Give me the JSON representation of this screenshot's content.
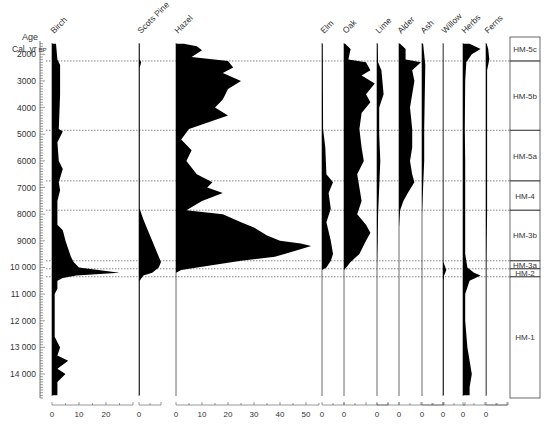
{
  "header": {
    "age_label": "Age",
    "age_unit": "Cal. yr",
    "age_unit_suffix": "BP"
  },
  "colors": {
    "fill": "#000000",
    "axis": "#555555",
    "dotted": "#555555",
    "text": "#333333"
  },
  "chart_data": {
    "type": "area",
    "title": "",
    "ylabel": "Age Cal. yr BP",
    "xlabel": "%",
    "y_axis": {
      "range": [
        1500,
        15000
      ],
      "ticks": [
        2000,
        3000,
        4000,
        5000,
        6000,
        7000,
        8000,
        9000,
        10000,
        11000,
        12000,
        13000,
        14000
      ],
      "tick_labels": [
        "2000",
        "3000",
        "4000",
        "5000",
        "6000",
        "7000",
        "8000",
        "9000",
        "10 000",
        "11 000",
        "12 000",
        "13 000",
        "14 000"
      ],
      "minor_step": 100
    },
    "zones": [
      {
        "name": "HM-5c",
        "top": 1500,
        "bottom": 2250
      },
      {
        "name": "HM-5b",
        "top": 2250,
        "bottom": 4850
      },
      {
        "name": "HM-5a",
        "top": 4850,
        "bottom": 6750
      },
      {
        "name": "HM-4",
        "top": 6750,
        "bottom": 7850
      },
      {
        "name": "HM-3b",
        "top": 7850,
        "bottom": 9750
      },
      {
        "name": "HM-3a",
        "top": 9750,
        "bottom": 10050
      },
      {
        "name": "HM-2",
        "top": 10050,
        "bottom": 10350
      },
      {
        "name": "HM-1",
        "top": 10350,
        "bottom": 14900
      }
    ],
    "zone_boundaries": [
      2250,
      4850,
      6750,
      7850,
      9750,
      10050,
      10350
    ],
    "series": [
      {
        "name": "Birch",
        "x0": 52,
        "scale_max": 30,
        "px_per_unit": 2.7,
        "ticks": [
          0,
          10,
          20
        ],
        "tick_labels": [
          "0",
          "10",
          "20"
        ],
        "points": [
          [
            1600,
            1.5
          ],
          [
            2200,
            2
          ],
          [
            2400,
            3
          ],
          [
            3500,
            3
          ],
          [
            4800,
            2.5
          ],
          [
            4900,
            4
          ],
          [
            5300,
            2
          ],
          [
            6000,
            2.5
          ],
          [
            6300,
            4
          ],
          [
            6800,
            2.5
          ],
          [
            7100,
            3
          ],
          [
            7500,
            2
          ],
          [
            8100,
            2
          ],
          [
            8400,
            2
          ],
          [
            8600,
            4
          ],
          [
            9000,
            5
          ],
          [
            9300,
            6
          ],
          [
            9600,
            7
          ],
          [
            9800,
            8
          ],
          [
            10000,
            10
          ],
          [
            10200,
            25
          ],
          [
            10300,
            9
          ],
          [
            10400,
            4
          ],
          [
            10500,
            2
          ],
          [
            10800,
            2
          ],
          [
            11000,
            1
          ],
          [
            12000,
            1
          ],
          [
            12600,
            1
          ],
          [
            13000,
            3
          ],
          [
            13300,
            2
          ],
          [
            13500,
            6
          ],
          [
            13800,
            2
          ],
          [
            14000,
            5
          ],
          [
            14300,
            2
          ],
          [
            14800,
            2
          ]
        ]
      },
      {
        "name": "Scots Pine",
        "x0": 139,
        "scale_max": 10,
        "px_per_unit": 2.2,
        "ticks": [
          0
        ],
        "tick_labels": [
          "0"
        ],
        "points": [
          [
            1600,
            0.3
          ],
          [
            2200,
            0.3
          ],
          [
            2300,
            1
          ],
          [
            2500,
            0.3
          ],
          [
            7800,
            0.3
          ],
          [
            8200,
            2
          ],
          [
            8600,
            4
          ],
          [
            9000,
            6
          ],
          [
            9400,
            8
          ],
          [
            9800,
            10
          ],
          [
            10000,
            9
          ],
          [
            10200,
            6
          ],
          [
            10300,
            2
          ],
          [
            10500,
            0.3
          ],
          [
            14800,
            0.3
          ]
        ]
      },
      {
        "name": "Hazel",
        "x0": 176,
        "scale_max": 55,
        "px_per_unit": 2.6,
        "ticks": [
          0,
          10,
          20,
          30,
          40,
          50
        ],
        "tick_labels": [
          "0",
          "10",
          "20",
          "30",
          "40",
          "50"
        ],
        "points": [
          [
            1600,
            3
          ],
          [
            1700,
            8
          ],
          [
            1850,
            10
          ],
          [
            2100,
            6
          ],
          [
            2250,
            20
          ],
          [
            2500,
            22
          ],
          [
            2700,
            18
          ],
          [
            3000,
            25
          ],
          [
            3300,
            20
          ],
          [
            3700,
            18
          ],
          [
            4000,
            15
          ],
          [
            4300,
            20
          ],
          [
            4800,
            5
          ],
          [
            5200,
            2
          ],
          [
            5600,
            6
          ],
          [
            6000,
            4
          ],
          [
            6500,
            8
          ],
          [
            6800,
            14
          ],
          [
            7000,
            12
          ],
          [
            7200,
            18
          ],
          [
            7500,
            10
          ],
          [
            7850,
            4
          ],
          [
            8000,
            18
          ],
          [
            8300,
            25
          ],
          [
            8500,
            30
          ],
          [
            8800,
            35
          ],
          [
            9000,
            40
          ],
          [
            9100,
            48
          ],
          [
            9200,
            52
          ],
          [
            9400,
            45
          ],
          [
            9600,
            38
          ],
          [
            9750,
            25
          ],
          [
            9900,
            15
          ],
          [
            10050,
            5
          ],
          [
            10100,
            2
          ],
          [
            10200,
            0
          ],
          [
            14800,
            0
          ]
        ]
      },
      {
        "name": "Elm",
        "x0": 322,
        "scale_max": 10,
        "px_per_unit": 2.2,
        "ticks": [
          0
        ],
        "tick_labels": [
          "0"
        ],
        "points": [
          [
            1600,
            0.3
          ],
          [
            4800,
            0.5
          ],
          [
            5500,
            1.5
          ],
          [
            6500,
            2
          ],
          [
            6800,
            5
          ],
          [
            7200,
            3
          ],
          [
            7800,
            4
          ],
          [
            8300,
            2
          ],
          [
            9000,
            4
          ],
          [
            9500,
            5
          ],
          [
            9750,
            4
          ],
          [
            10000,
            2
          ],
          [
            10100,
            0
          ],
          [
            14800,
            0
          ]
        ]
      },
      {
        "name": "Oak",
        "x0": 344,
        "scale_max": 20,
        "px_per_unit": 2.2,
        "ticks": [
          0
        ],
        "tick_labels": [
          "0"
        ],
        "points": [
          [
            1600,
            0.5
          ],
          [
            1800,
            3
          ],
          [
            2200,
            2
          ],
          [
            2300,
            10
          ],
          [
            2600,
            12
          ],
          [
            2800,
            8
          ],
          [
            3100,
            14
          ],
          [
            3500,
            10
          ],
          [
            3800,
            12
          ],
          [
            4200,
            8
          ],
          [
            4800,
            7
          ],
          [
            5500,
            8
          ],
          [
            6000,
            9
          ],
          [
            6500,
            6
          ],
          [
            7000,
            7
          ],
          [
            7500,
            8
          ],
          [
            8000,
            6
          ],
          [
            8400,
            10
          ],
          [
            8700,
            12
          ],
          [
            9000,
            10
          ],
          [
            9500,
            7
          ],
          [
            9800,
            3
          ],
          [
            10000,
            1
          ],
          [
            10100,
            0
          ],
          [
            14800,
            0
          ]
        ]
      },
      {
        "name": "Lime",
        "x0": 377,
        "scale_max": 10,
        "px_per_unit": 2.2,
        "ticks": [
          0
        ],
        "tick_labels": [
          "0"
        ],
        "points": [
          [
            1600,
            0.3
          ],
          [
            2300,
            0.5
          ],
          [
            2600,
            2
          ],
          [
            3500,
            3
          ],
          [
            4000,
            1
          ],
          [
            5000,
            1
          ],
          [
            6000,
            1.5
          ],
          [
            7000,
            1
          ],
          [
            8000,
            0.5
          ],
          [
            9000,
            0.3
          ],
          [
            10000,
            0
          ],
          [
            14800,
            0
          ]
        ]
      },
      {
        "name": "Alder",
        "x0": 399,
        "scale_max": 20,
        "px_per_unit": 2.2,
        "ticks": [
          0
        ],
        "tick_labels": [
          "0"
        ],
        "points": [
          [
            1600,
            0.5
          ],
          [
            1800,
            3
          ],
          [
            2200,
            3
          ],
          [
            2300,
            10
          ],
          [
            2600,
            6
          ],
          [
            3000,
            7
          ],
          [
            3500,
            6
          ],
          [
            4000,
            5
          ],
          [
            4800,
            6
          ],
          [
            5500,
            6
          ],
          [
            6000,
            5
          ],
          [
            6500,
            6
          ],
          [
            6800,
            7
          ],
          [
            7200,
            4
          ],
          [
            7500,
            2
          ],
          [
            7850,
            0.5
          ],
          [
            8500,
            0
          ],
          [
            14800,
            0
          ]
        ]
      },
      {
        "name": "Ash",
        "x0": 422,
        "scale_max": 10,
        "px_per_unit": 2.2,
        "ticks": [
          0
        ],
        "tick_labels": [
          "0"
        ],
        "points": [
          [
            1600,
            0.5
          ],
          [
            2000,
            1
          ],
          [
            2400,
            1.5
          ],
          [
            4800,
            1
          ],
          [
            6000,
            1
          ],
          [
            7000,
            0.5
          ],
          [
            8000,
            0
          ],
          [
            14800,
            0
          ]
        ]
      },
      {
        "name": "Willow",
        "x0": 443,
        "scale_max": 10,
        "px_per_unit": 2.2,
        "ticks": [
          0
        ],
        "tick_labels": [
          "0"
        ],
        "points": [
          [
            1600,
            0.2
          ],
          [
            9800,
            0.2
          ],
          [
            10100,
            1.5
          ],
          [
            10300,
            0.5
          ],
          [
            10500,
            0.3
          ],
          [
            14800,
            0.3
          ]
        ]
      },
      {
        "name": "Herbs",
        "x0": 463,
        "scale_max": 20,
        "px_per_unit": 2.2,
        "ticks": [
          0
        ],
        "tick_labels": [
          "0"
        ],
        "points": [
          [
            1600,
            3
          ],
          [
            1800,
            8
          ],
          [
            2000,
            4
          ],
          [
            2300,
            1.5
          ],
          [
            3000,
            1
          ],
          [
            4800,
            0.8
          ],
          [
            6000,
            1
          ],
          [
            8000,
            1
          ],
          [
            9500,
            1
          ],
          [
            10000,
            2
          ],
          [
            10200,
            5
          ],
          [
            10300,
            8
          ],
          [
            10500,
            3
          ],
          [
            11000,
            1
          ],
          [
            12000,
            1
          ],
          [
            13000,
            2
          ],
          [
            13500,
            3
          ],
          [
            14000,
            4
          ],
          [
            14500,
            3
          ],
          [
            14800,
            3
          ]
        ]
      },
      {
        "name": "Ferns",
        "x0": 486,
        "scale_max": 10,
        "px_per_unit": 2.2,
        "ticks": [
          0
        ],
        "tick_labels": [
          "0"
        ],
        "points": [
          [
            1600,
            0.3
          ],
          [
            1800,
            1
          ],
          [
            2200,
            1.5
          ],
          [
            2600,
            0.5
          ],
          [
            6000,
            0.5
          ],
          [
            8000,
            0.5
          ],
          [
            9000,
            0.3
          ],
          [
            10000,
            0.2
          ],
          [
            14800,
            0.2
          ]
        ]
      }
    ],
    "legend": [],
    "grid": false
  },
  "layout": {
    "y_top_px": 41,
    "y_bottom_px": 398,
    "age_top": 1500,
    "age_bottom": 14900,
    "zone_box": {
      "x": 510,
      "w": 30
    }
  }
}
